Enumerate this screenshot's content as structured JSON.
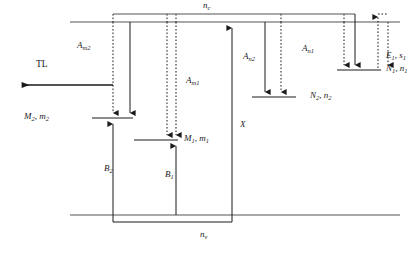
{
  "diagram": {
    "title_semantic": "energy-band-trap-level-diagram",
    "bands": {
      "conduction": {
        "label": "n",
        "sub": "c",
        "y": 22
      },
      "valence": {
        "label": "n",
        "sub": "v",
        "y": 215
      }
    },
    "levels": [
      {
        "id": "M2",
        "label": "M",
        "sub": "2",
        "label2": "m",
        "sub2": "2",
        "text": "M2, m2",
        "y": 118
      },
      {
        "id": "M1",
        "label": "M",
        "sub": "1",
        "label2": "m",
        "sub2": "1",
        "text": "M1, m1",
        "y": 140
      },
      {
        "id": "N2",
        "label": "N",
        "sub": "2",
        "label2": "n",
        "sub2": "2",
        "text": "N2, n2",
        "y": 97
      },
      {
        "id": "N1",
        "label": "N",
        "sub": "1",
        "label2": "n",
        "sub2": "1",
        "text": "N1, n1",
        "y": 70
      },
      {
        "id": "E1",
        "label": "E",
        "sub": "1",
        "label2": "s",
        "sub2": "1",
        "text": "E1, s1",
        "y": 70
      }
    ],
    "transitions": [
      {
        "id": "Am2",
        "label": "A",
        "sub": "m2",
        "kind": "solid-down",
        "from": "conduction",
        "to": "M2"
      },
      {
        "id": "Am1",
        "label": "A",
        "sub": "m1",
        "kind": "solid-down",
        "from": "conduction",
        "to": "M1"
      },
      {
        "id": "An2",
        "label": "A",
        "sub": "n2",
        "kind": "solid-down",
        "from": "conduction",
        "to": "N2"
      },
      {
        "id": "An1",
        "label": "A",
        "sub": "n1",
        "kind": "solid-down",
        "from": "conduction",
        "to": "N1"
      },
      {
        "id": "B2",
        "label": "B",
        "sub": "2",
        "kind": "solid-up",
        "from": "valence",
        "to": "M2"
      },
      {
        "id": "B1",
        "label": "B",
        "sub": "1",
        "kind": "solid-up",
        "from": "valence",
        "to": "M1"
      },
      {
        "id": "X",
        "label": "X",
        "sub": "",
        "kind": "solid-up",
        "from": "valence",
        "to": "conduction"
      },
      {
        "id": "TL",
        "label": "TL",
        "sub": "",
        "kind": "emission-left",
        "from": "M2",
        "to": "left"
      }
    ],
    "labels": {
      "nc": {
        "base": "n",
        "sub": "c"
      },
      "nv": {
        "base": "n",
        "sub": "v"
      },
      "TL": "TL",
      "Am2": {
        "base": "A",
        "sub": "m2"
      },
      "Am1": {
        "base": "A",
        "sub": "m1"
      },
      "An2": {
        "base": "A",
        "sub": "n2"
      },
      "An1": {
        "base": "A",
        "sub": "n1"
      },
      "B2": {
        "base": "B",
        "sub": "2"
      },
      "B1": {
        "base": "B",
        "sub": "1"
      },
      "X": {
        "base": "X",
        "sub": ""
      },
      "M2m2": {
        "a": "M",
        "asub": "2",
        "b": "m",
        "bsub": "2"
      },
      "M1m1": {
        "a": "M",
        "asub": "1",
        "b": "m",
        "bsub": "1"
      },
      "N2n2": {
        "a": "N",
        "asub": "2",
        "b": "n",
        "bsub": "2"
      },
      "N1n1": {
        "a": "N",
        "asub": "1",
        "b": "n",
        "bsub": "1"
      },
      "E1s1": {
        "a": "E",
        "asub": "1",
        "b": "s",
        "bsub": "1"
      }
    },
    "colors": {
      "line": "#1a1a1a",
      "text": "#1a1a1a",
      "background": "#ffffff"
    }
  }
}
